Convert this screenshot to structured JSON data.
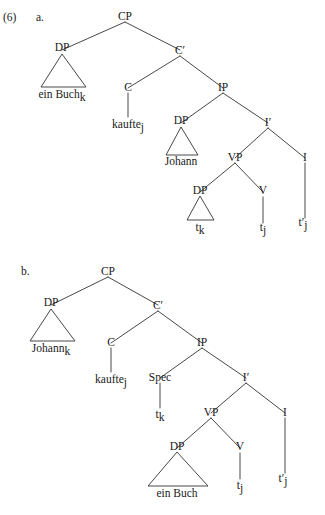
{
  "figure": {
    "example_number": "(6)",
    "item_a_label": "a.",
    "item_b_label": "b.",
    "line_color": "#333333",
    "text_color": "#1a1a1a",
    "background": "#ffffff"
  },
  "tree_a": {
    "id": "tree-a",
    "root": "CP",
    "nodes": {
      "cp": "CP",
      "dp_spec": "DP",
      "cbar": "C′",
      "c": "C",
      "ip": "IP",
      "dp_subject": "DP",
      "ibar": "I′",
      "vp": "VP",
      "i": "I",
      "dp_object": "DP",
      "v": "V"
    },
    "leaves": {
      "ein_buch_k": {
        "base": "ein Buch",
        "sub": "k"
      },
      "kaufte_j": {
        "base": "kaufte",
        "sub": "j"
      },
      "johann": {
        "base": "Johann",
        "sub": ""
      },
      "trace_k": {
        "base": "t",
        "sub": "k"
      },
      "trace_j": {
        "base": "t",
        "sub": "j"
      },
      "trace_prime_j": {
        "base": "t′",
        "sub": "j"
      }
    }
  },
  "tree_b": {
    "id": "tree-b",
    "root": "CP",
    "nodes": {
      "cp": "CP",
      "dp_spec": "DP",
      "cbar": "C′",
      "c": "C",
      "ip": "IP",
      "spec": "Spec",
      "ibar": "I′",
      "vp": "VP",
      "i": "I",
      "dp_object": "DP",
      "v": "V"
    },
    "leaves": {
      "johann_k": {
        "base": "Johann",
        "sub": "k"
      },
      "kaufte_j": {
        "base": "kaufte",
        "sub": "j"
      },
      "trace_k": {
        "base": "t",
        "sub": "k"
      },
      "ein_buch": {
        "base": "ein Buch",
        "sub": ""
      },
      "trace_j": {
        "base": "t",
        "sub": "j"
      },
      "trace_prime_j": {
        "base": "t′",
        "sub": "j"
      }
    }
  }
}
